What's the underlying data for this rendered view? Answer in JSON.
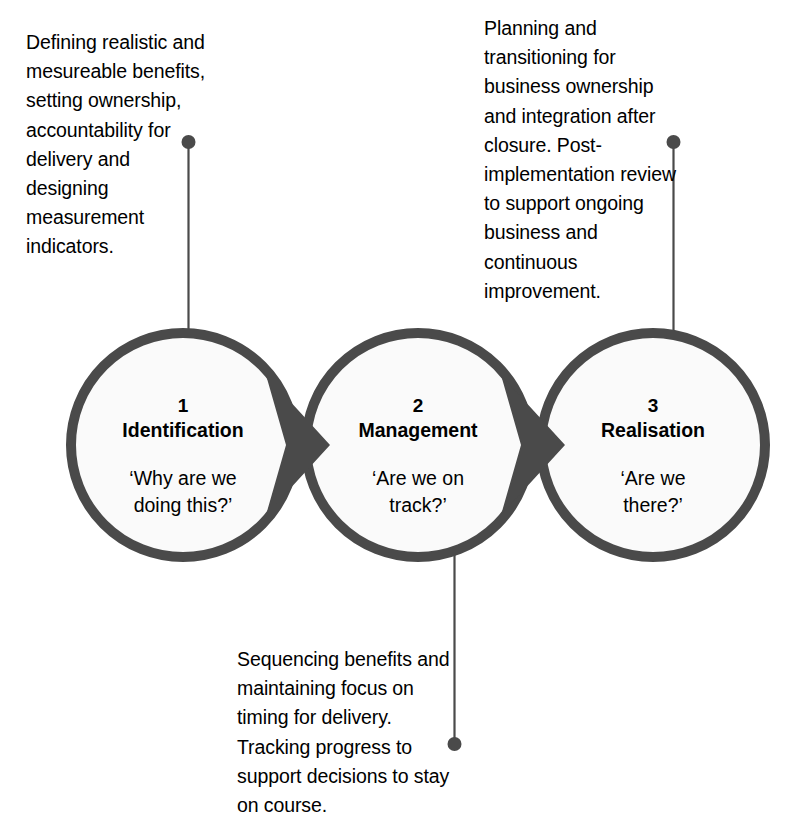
{
  "diagram": {
    "type": "process-flow",
    "colors": {
      "stroke": "#4a4a4a",
      "arrow": "#4a4a4a",
      "circle_fill": "#fafafa",
      "connector": "#4a4a4a",
      "text": "#000000",
      "background": "#ffffff"
    },
    "stages": [
      {
        "number": "1",
        "title": "Identification",
        "question": "‘Why are we\ndoing this?’",
        "callout": "Defining realistic and mesureable benefits, setting ownership, accountability for delivery and designing measurement indicators.",
        "callout_position": "top-left"
      },
      {
        "number": "2",
        "title": "Management",
        "question": "‘Are we on\ntrack?’",
        "callout": "Sequencing benefits and maintaining focus on timing for delivery. Tracking progress to support decisions to stay on course.",
        "callout_position": "bottom-center"
      },
      {
        "number": "3",
        "title": "Realisation",
        "question": "‘Are we\nthere?’",
        "callout": "Planning and transitioning for business ownership and integration after closure. Post-implementation review to support ongoing business and continuous improvement.",
        "callout_position": "top-right"
      }
    ],
    "arrows": [
      {
        "from": "Identification",
        "to": "Management"
      },
      {
        "from": "Management",
        "to": "Realisation"
      }
    ]
  }
}
